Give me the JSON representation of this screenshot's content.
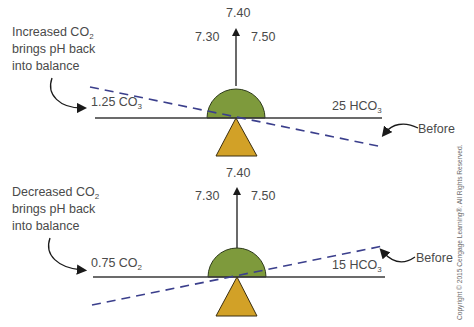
{
  "colors": {
    "beam": "#3a3a3a",
    "dashed_line": "#3b3f8c",
    "fulcrum_semicircle": "#7e9a3c",
    "fulcrum_triangle": "#d2a127",
    "text": "#4a4a4a"
  },
  "panels": [
    {
      "id": "top",
      "caption_lines": [
        "Increased CO",
        "brings pH back",
        "into balance"
      ],
      "caption_sub": "2",
      "left_label": "1.25 CO",
      "left_label_sub": "3",
      "right_label": "25 HCO",
      "right_label_sub": "3",
      "before_label": "Before",
      "scale": {
        "left": "7.30",
        "center": "7.40",
        "right": "7.50"
      },
      "tilt": "dashed line slopes down to the right"
    },
    {
      "id": "bottom",
      "caption_lines": [
        "Decreased CO",
        "brings pH back",
        "into balance"
      ],
      "caption_sub": "2",
      "left_label": "0.75 CO",
      "left_label_sub": "2",
      "right_label": "15 HCO",
      "right_label_sub": "3",
      "before_label": "Before",
      "scale": {
        "left": "7.30",
        "center": "7.40",
        "right": "7.50"
      },
      "tilt": "dashed line slopes up to the right"
    }
  ],
  "copyright": "Copyright © 2015 Cengage Learning®. All Rights Reserved."
}
